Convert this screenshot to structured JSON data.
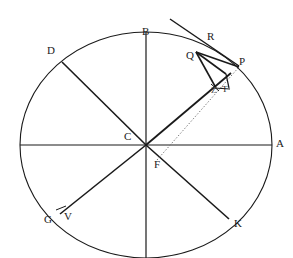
{
  "figure": {
    "type": "geometry-diagram",
    "title": "",
    "canvas": {
      "width": 293,
      "height": 258
    },
    "stroke_color": "#1a1a1a",
    "background_color": "#ffffff",
    "ellipse": {
      "center": {
        "x": 146,
        "y": 145
      },
      "radius_x": 126,
      "radius_y": 113
    },
    "labels": [
      {
        "id": "A",
        "text": "A",
        "x": 276,
        "y": 138
      },
      {
        "id": "B",
        "text": "B",
        "x": 142,
        "y": 26
      },
      {
        "id": "C",
        "text": "C",
        "x": 124,
        "y": 131
      },
      {
        "id": "D",
        "text": "D",
        "x": 47,
        "y": 45
      },
      {
        "id": "F",
        "text": "F",
        "x": 154,
        "y": 159
      },
      {
        "id": "G",
        "text": "G",
        "x": 44,
        "y": 214
      },
      {
        "id": "K",
        "text": "K",
        "x": 234,
        "y": 218
      },
      {
        "id": "P",
        "text": "P",
        "x": 239,
        "y": 56
      },
      {
        "id": "Q",
        "text": "Q",
        "x": 186,
        "y": 50
      },
      {
        "id": "R",
        "text": "R",
        "x": 207,
        "y": 31
      },
      {
        "id": "T",
        "text": "T",
        "x": 222,
        "y": 84
      },
      {
        "id": "V",
        "text": "V",
        "x": 64,
        "y": 211
      },
      {
        "id": "Z",
        "text": "Z",
        "x": 211,
        "y": 85
      }
    ],
    "points": {
      "A": {
        "x": 272,
        "y": 145
      },
      "B": {
        "x": 146,
        "y": 32
      },
      "C": {
        "x": 146,
        "y": 145
      },
      "D": {
        "x": 62,
        "y": 62
      },
      "F": {
        "x": 160,
        "y": 152
      },
      "G": {
        "x": 62,
        "y": 213
      },
      "K": {
        "x": 228,
        "y": 218
      },
      "P": {
        "x": 238,
        "y": 68
      },
      "Q": {
        "x": 196,
        "y": 52
      },
      "R": {
        "x": 208,
        "y": 41
      },
      "T": {
        "x": 215,
        "y": 88
      },
      "V": {
        "x": 61,
        "y": 212
      },
      "W": {
        "x": 224,
        "y": 72
      },
      "L": {
        "x": 230,
        "y": 88
      },
      "tangent_end": {
        "x": 171,
        "y": 20
      }
    },
    "segments": [
      {
        "name": "diameter-horizontal",
        "from": "left-vertex",
        "to": "A",
        "style": "solid"
      },
      {
        "name": "diameter-vertical",
        "from": "B",
        "to": "bottom-vertex",
        "style": "solid"
      },
      {
        "name": "radius-C-D",
        "from": "C",
        "to": "D",
        "style": "solid"
      },
      {
        "name": "radius-C-G",
        "from": "C",
        "to": "G",
        "style": "solid"
      },
      {
        "name": "radius-C-K",
        "from": "C",
        "to": "K",
        "style": "solid"
      },
      {
        "name": "radius-C-T",
        "from": "C",
        "to": "T",
        "style": "solid"
      },
      {
        "name": "chord-F-P",
        "from": "F",
        "to": "P",
        "style": "dotted"
      },
      {
        "name": "tangent-at-Q",
        "from": "tangent_end",
        "to": "P",
        "style": "solid"
      },
      {
        "name": "segment-Q-P",
        "from": "Q",
        "to": "P",
        "style": "solid"
      },
      {
        "name": "segment-Q-W",
        "from": "Q",
        "to": "W",
        "style": "solid"
      },
      {
        "name": "segment-Q-T",
        "from": "Q",
        "to": "T",
        "style": "solid"
      },
      {
        "name": "segment-W-L",
        "from": "W",
        "to": "L",
        "style": "solid"
      },
      {
        "name": "tick-at-V",
        "from": "V",
        "to": "V-tick",
        "style": "solid"
      }
    ]
  }
}
